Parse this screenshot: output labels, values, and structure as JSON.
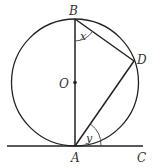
{
  "diagram": {
    "labels": {
      "B": "B",
      "O": "O",
      "D": "D",
      "A": "A",
      "C": "C",
      "x": "x",
      "y": "y"
    },
    "colors": {
      "stroke": "#222222",
      "text": "#333333"
    }
  }
}
